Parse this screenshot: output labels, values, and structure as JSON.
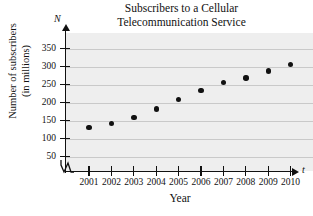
{
  "chart_data": {
    "type": "scatter",
    "title": "Subscribers to a Cellular Telecommunication Service",
    "title_lines": [
      "Subscribers to a Cellular",
      "Telecommunication Service"
    ],
    "xlabel": "Year",
    "ylabel": "Number of subscribers (in millions)",
    "ylabel_lines": [
      "Number of subscribers",
      "(in millions)"
    ],
    "x_axis_variable": "t",
    "y_axis_variable": "N",
    "categories": [
      2001,
      2002,
      2003,
      2004,
      2005,
      2006,
      2007,
      2008,
      2009,
      2010
    ],
    "x_tick_labels": [
      "2001",
      "2002",
      "2003",
      "2004",
      "2005",
      "2006",
      "2007",
      "2008",
      "2009",
      "2010"
    ],
    "values": [
      130,
      141,
      159,
      182,
      208,
      233,
      255,
      268,
      287,
      305
    ],
    "y_ticks": [
      50,
      100,
      150,
      200,
      250,
      300,
      350
    ],
    "y_tick_labels": [
      "50",
      "100",
      "150",
      "200",
      "250",
      "300",
      "350"
    ],
    "ylim": [
      0,
      375
    ],
    "xlim": [
      2000.3,
      2010.8
    ],
    "grid": true,
    "grid_orientation": "horizontal",
    "legend": null,
    "axis_break": true,
    "marker": "filled-circle",
    "marker_color": "#111111",
    "plot_background": "#eeeeee",
    "gridline_color": "#c9c9c9"
  }
}
